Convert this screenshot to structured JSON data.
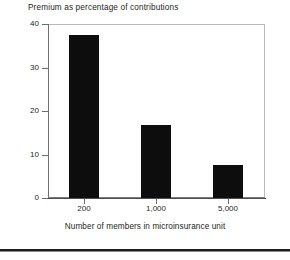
{
  "chart_data": {
    "type": "bar",
    "title": "Premium as percentage of contributions",
    "subtitle": "",
    "xlabel": "Number of members in microinsurance unit",
    "ylabel": "",
    "categories": [
      "200",
      "1,000",
      "5,000"
    ],
    "values": [
      37.5,
      16.8,
      7.5
    ],
    "series": [
      {
        "name": "Premium as percentage of contributions",
        "values": [
          37.5,
          16.8,
          7.5
        ]
      }
    ],
    "ylim": [
      0,
      40
    ],
    "yticks": [
      0,
      10,
      20,
      30,
      40
    ],
    "ytick_labels": [
      "0",
      "10",
      "20",
      "30",
      "40"
    ],
    "grid": false,
    "legend": false,
    "legend_position": "none",
    "bar_color": "#0d0d0d",
    "axis_color": "#6e6e6e",
    "background_color": "#ffffff",
    "text_color": "#231f20"
  },
  "figure": {
    "title": "Premium as percentage of contributions",
    "xaxis_title": "Number of members in microinsurance unit",
    "ytick_0": "0",
    "ytick_1": "10",
    "ytick_2": "20",
    "ytick_3": "30",
    "ytick_4": "40",
    "xtick_0": "200",
    "xtick_1": "1,000",
    "xtick_2": "5,000"
  }
}
